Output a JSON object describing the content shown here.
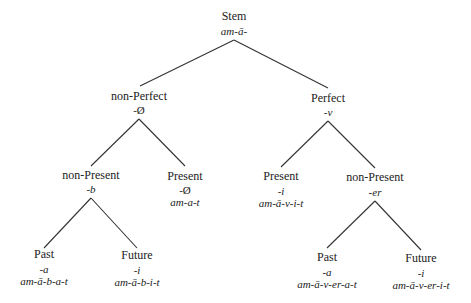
{
  "diagram": {
    "type": "tree",
    "nodes": {
      "stem": {
        "label": "Stem",
        "suffix": "am-ā-"
      },
      "non_perfect": {
        "label": "non-Perfect",
        "suffix": "-Ø"
      },
      "perfect": {
        "label": "Perfect",
        "suffix": "-v"
      },
      "np_non_present": {
        "label": "non-Present",
        "suffix": "-b"
      },
      "np_present": {
        "label": "Present",
        "suffix": "-Ø",
        "form": "am-a-t"
      },
      "p_present": {
        "label": "Present",
        "suffix": "-i",
        "form": "am-ā-v-i-t"
      },
      "p_non_present": {
        "label": "non-Present",
        "suffix": "-er"
      },
      "np_past": {
        "label": "Past",
        "suffix": "-a",
        "form": "am-ā-b-a-t"
      },
      "np_future": {
        "label": "Future",
        "suffix": "-i",
        "form": "am-ā-b-i-t"
      },
      "p_past": {
        "label": "Past",
        "suffix": "-a",
        "form": "am-ā-v-er-a-t"
      },
      "p_future": {
        "label": "Future",
        "suffix": "-i",
        "form": "am-ā-v-er-i-t"
      }
    },
    "edges": [
      [
        "stem",
        "non_perfect"
      ],
      [
        "stem",
        "perfect"
      ],
      [
        "non_perfect",
        "np_non_present"
      ],
      [
        "non_perfect",
        "np_present"
      ],
      [
        "perfect",
        "p_present"
      ],
      [
        "perfect",
        "p_non_present"
      ],
      [
        "np_non_present",
        "np_past"
      ],
      [
        "np_non_present",
        "np_future"
      ],
      [
        "p_non_present",
        "p_past"
      ],
      [
        "p_non_present",
        "p_future"
      ]
    ],
    "line_color": "#333333",
    "text_color": "#222222"
  }
}
